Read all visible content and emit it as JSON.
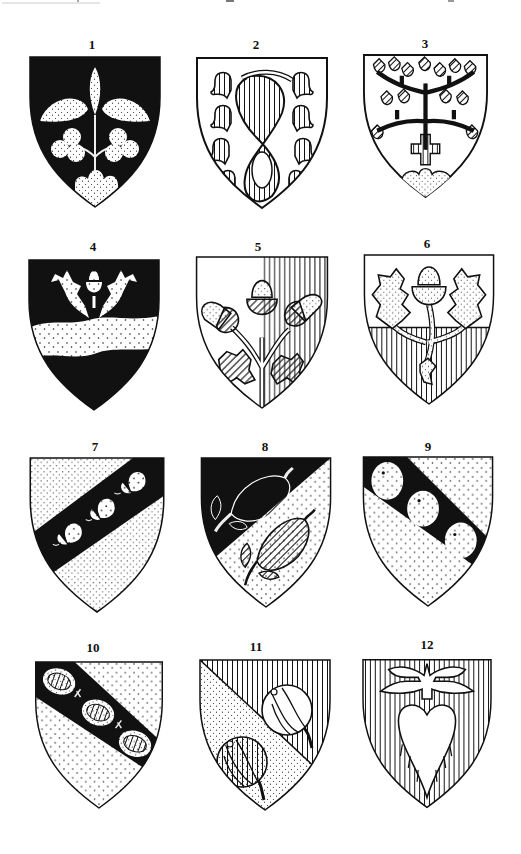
{
  "plate": {
    "background": "#ffffff",
    "ink": "#111111"
  },
  "shields": [
    {
      "label": "1",
      "description": "Black field; pale (dotted) trefoil plant with three leaves, two clover-trefoils and mound in base"
    },
    {
      "label": "2",
      "description": "White field; vertical-hatched looped knot with eight hatched linden leaves"
    },
    {
      "label": "3",
      "description": "White field; linden tree with diagonal-hatched leaves, cross patée, dotted mound in base"
    },
    {
      "label": "4",
      "description": "Black field; dotted wavy fess, acorn between two oak leaves in chief"
    },
    {
      "label": "5",
      "description": "Per pale white and vertical-hatched; three acorns on branch with two oak leaves"
    },
    {
      "label": "6",
      "description": "Per fess white and vertical-hatched; dotted acorn between two oak leaves on branch"
    },
    {
      "label": "7",
      "description": "Dotted field; black bend sinister charged with three acorns"
    },
    {
      "label": "8",
      "description": "Per bend sinister black and dotted; two hatched pods with leaves"
    },
    {
      "label": "9",
      "description": "Dotted field; black bend charged with three dotted roundels"
    },
    {
      "label": "10",
      "description": "Dotted field; black bend charged with three hatched gooseberries"
    },
    {
      "label": "11",
      "description": "Per bend dotted and vertical-hatched; two hatched melons"
    },
    {
      "label": "12",
      "description": "Vertical-hatched field; white heart with winged crown above"
    }
  ]
}
